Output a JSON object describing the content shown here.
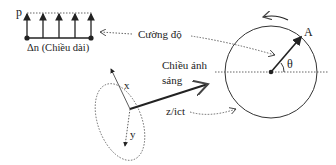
{
  "labels": {
    "p": "p",
    "delta_n": "Δn (Chiều dài)",
    "intensity": "Cường độ",
    "light_dir_line1": "Chiều ánh",
    "light_dir_line2": "sáng",
    "x": "x",
    "y": "y",
    "z": "z/ict",
    "A": "A",
    "theta": "θ"
  },
  "colors": {
    "ink": "#222222",
    "dotted": "#666666"
  }
}
